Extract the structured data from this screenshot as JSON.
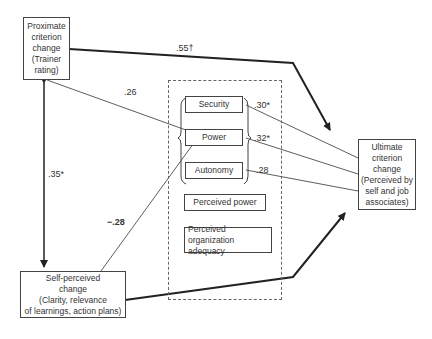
{
  "nodes": {
    "proximate": {
      "lines": [
        "Proximate",
        "criterion",
        "change",
        "(Trainer",
        "rating)"
      ]
    },
    "self_perceived": {
      "lines": [
        "Self-perceived",
        "change",
        "(Clarity, relevance",
        "of learnings, action plans)"
      ]
    },
    "ultimate": {
      "lines": [
        "Ultimate",
        "criterion",
        "change",
        "(Perceived by",
        "self and job",
        "associates)"
      ]
    },
    "security": {
      "label": "Security"
    },
    "power": {
      "label": "Power"
    },
    "autonomy": {
      "label": "Autonomy"
    },
    "perceived_power": {
      "label": "Perceived power"
    },
    "org_adequacy": {
      "lines": [
        "Perceived organization",
        "adequacy"
      ]
    }
  },
  "edges": {
    "proximate_to_ultimate": ".55†",
    "proximate_to_power": ".26",
    "proximate_self_correlation": ".35*",
    "self_to_power": "−.28",
    "security_to_ultimate": ".30*",
    "power_to_ultimate": ".32*",
    "autonomy_to_ultimate": ".28"
  }
}
